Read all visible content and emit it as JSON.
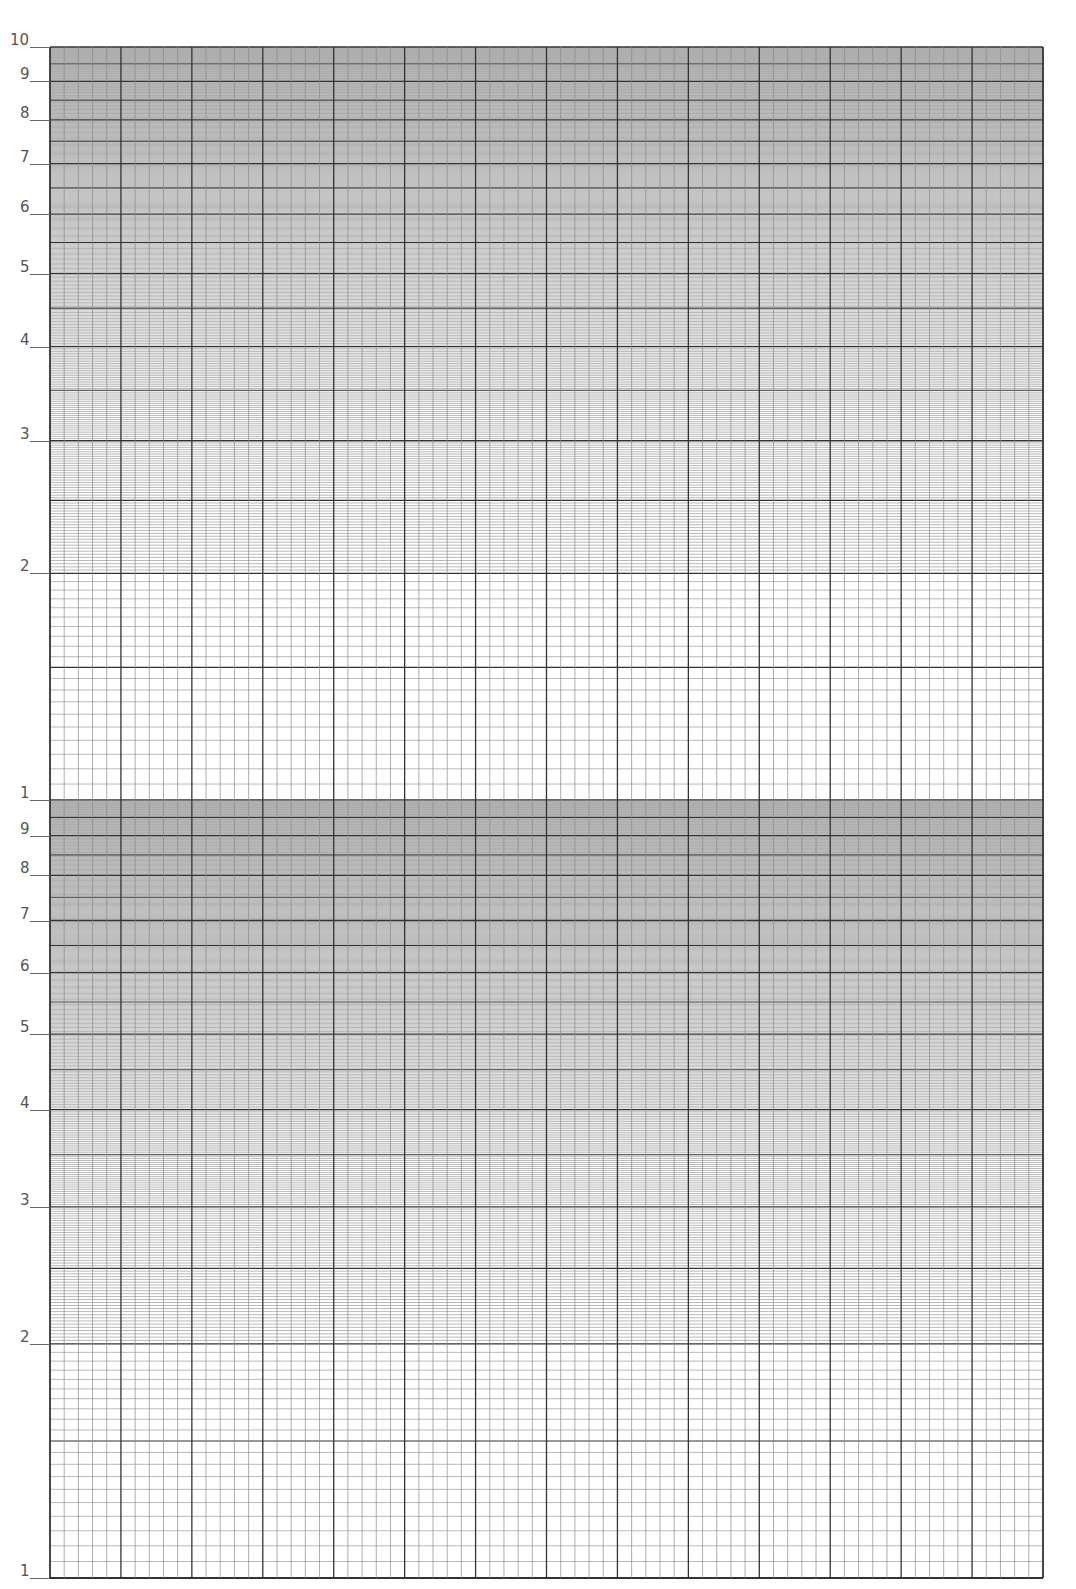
{
  "chart_data": {
    "type": "table",
    "title": "",
    "xlabel": "",
    "ylabel": "",
    "y_scale": "log",
    "y_cycles": 2,
    "x_scale": "linear",
    "x_major_divisions": 14,
    "x_minor_per_major": 5,
    "grid": true,
    "y_tick_labels_upper": [
      "10",
      "9",
      "8",
      "7",
      "6",
      "5",
      "4",
      "3",
      "2"
    ],
    "y_tick_labels_lower": [
      "1",
      "9",
      "8",
      "7",
      "6",
      "5",
      "4",
      "3",
      "2",
      "1"
    ],
    "series": []
  },
  "style": {
    "major_color": "#333333",
    "minor_color": "#8a8a8a",
    "label_color": "#555555"
  }
}
